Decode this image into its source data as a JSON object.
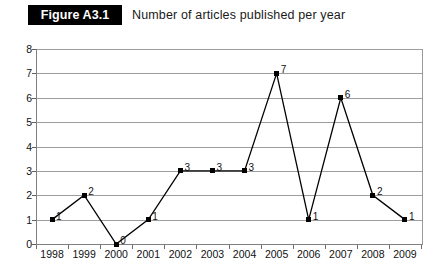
{
  "figure": {
    "badge": "Figure A3.1",
    "caption": "Number of articles published per year"
  },
  "chart_data": {
    "type": "line",
    "title": "Number of articles published per year",
    "xlabel": "",
    "ylabel": "",
    "categories": [
      "1998",
      "1999",
      "2000",
      "2001",
      "2002",
      "2003",
      "2004",
      "2005",
      "2006",
      "2007",
      "2008",
      "2009"
    ],
    "values": [
      1,
      2,
      0,
      1,
      3,
      3,
      3,
      7,
      1,
      6,
      2,
      1
    ],
    "point_labels": [
      "1",
      "2",
      "0",
      "1",
      "3",
      "3",
      "3",
      "7",
      "1",
      "6",
      "2",
      "1"
    ],
    "ylim": [
      0,
      8
    ],
    "ytick_labels": [
      "0",
      "1",
      "2",
      "3",
      "4",
      "5",
      "6",
      "7",
      "8"
    ],
    "yticks": [
      0,
      1,
      2,
      3,
      4,
      5,
      6,
      7,
      8
    ],
    "grid": "horizontal",
    "legend": "none",
    "marker": "square",
    "series_color": "#000000",
    "gridline_color": "#9d9d9d",
    "background_color": "#ffffff"
  }
}
